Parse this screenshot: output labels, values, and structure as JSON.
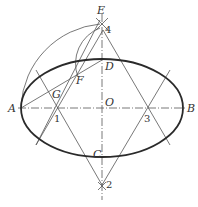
{
  "diagram": {
    "colors": {
      "stroke": "#2a2a2a",
      "thin": "#555555",
      "background": "#ffffff"
    },
    "points": {
      "A": {
        "label": "A",
        "x": 21,
        "y": 108
      },
      "B": {
        "label": "B",
        "x": 183,
        "y": 108
      },
      "O": {
        "label": "O",
        "x": 102,
        "y": 108
      },
      "C": {
        "label": "C",
        "x": 102,
        "y": 157
      },
      "D": {
        "label": "D",
        "x": 102,
        "y": 60
      },
      "E": {
        "label": "E",
        "x": 102,
        "y": 20
      },
      "F": {
        "label": "F",
        "x": 78,
        "y": 77
      },
      "G": {
        "label": "G",
        "x": 55,
        "y": 92
      },
      "P1": {
        "label": "1",
        "x": 58,
        "y": 108
      },
      "P2": {
        "label": "2",
        "x": 102,
        "y": 185
      },
      "P3": {
        "label": "3",
        "x": 147,
        "y": 108
      },
      "P4": {
        "label": "4",
        "x": 102,
        "y": 30
      }
    },
    "ellipse": {
      "cx": 102,
      "cy": 108,
      "rx": 81,
      "ry": 49
    }
  }
}
